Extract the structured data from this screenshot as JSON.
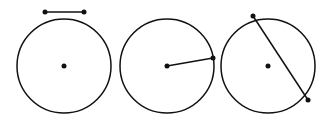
{
  "figure": {
    "stroke_color": "#111111",
    "background": "#ffffff",
    "panels": [
      {
        "name": "segment",
        "circle": {
          "cx": 64,
          "cy": 66,
          "r": 47
        },
        "center_dot": {
          "cx": 64,
          "cy": 66
        },
        "line": {
          "x1": 45,
          "y1": 12,
          "x2": 84,
          "y2": 12
        }
      },
      {
        "name": "radius",
        "circle": {
          "cx": 167,
          "cy": 66,
          "r": 47
        },
        "center_dot": {
          "cx": 167,
          "cy": 66
        },
        "line": {
          "x1": 167,
          "y1": 66,
          "x2": 213,
          "y2": 58
        }
      },
      {
        "name": "chord",
        "circle": {
          "cx": 268,
          "cy": 66,
          "r": 47
        },
        "center_dot": {
          "cx": 268,
          "cy": 66
        },
        "line": {
          "x1": 253,
          "y1": 16,
          "x2": 308,
          "y2": 100
        }
      }
    ]
  }
}
